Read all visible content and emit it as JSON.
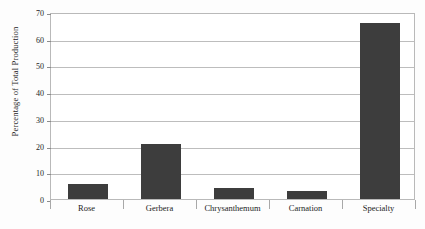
{
  "chart_data": {
    "type": "bar",
    "title": "",
    "subtitle": "",
    "xlabel": "",
    "ylabel": "Percentage of Total Production",
    "categories": [
      "Rose",
      "Gerbera",
      "Chrysanthemum",
      "Carnation",
      "Specialty"
    ],
    "values": [
      5.5,
      20.5,
      4,
      3,
      66
    ],
    "series": [
      {
        "name": "Percentage of Total Production",
        "values": [
          5.5,
          20.5,
          4,
          3,
          66
        ]
      }
    ],
    "ylim": [
      0,
      70
    ],
    "xlim": [
      0,
      5
    ],
    "ytick_labels": [
      "0",
      "10",
      "20",
      "30",
      "40",
      "50",
      "60",
      "70"
    ],
    "ytick_values": [
      0,
      10,
      20,
      30,
      40,
      50,
      60,
      70
    ],
    "grid": "horizontal",
    "legend": "none",
    "legend_position": "none",
    "annotations": [],
    "bar_color": "#3d3d3d",
    "grid_color": "#bdbdbd",
    "axis_color": "#b9b9b9",
    "background_color": "#ffffff"
  }
}
